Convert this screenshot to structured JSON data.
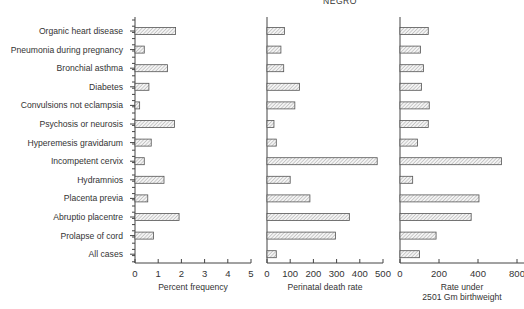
{
  "title": "NEGRO",
  "categories": [
    "Organic heart disease",
    "Pneumonia during pregnancy",
    "Bronchial asthma",
    "Diabetes",
    "Convulsions not eclampsia",
    "Psychosis or neurosis",
    "Hyperemesis gravidarum",
    "Incompetent cervix",
    "Hydramnios",
    "Placenta previa",
    "Abruptio placentre",
    "Prolapse of cord",
    "All cases"
  ],
  "panels": [
    {
      "xlabel": "Percent frequency",
      "xlabel2": "",
      "ticks": [
        "0",
        "1",
        "2",
        "3",
        "4",
        "5"
      ]
    },
    {
      "xlabel": "Perinatal death rate",
      "xlabel2": "",
      "ticks": [
        "0",
        "100",
        "200",
        "300",
        "400",
        "500"
      ]
    },
    {
      "xlabel": "Rate under",
      "xlabel2": "2501 Gm birthweight",
      "ticks": [
        "0",
        "200",
        "400",
        "800"
      ]
    }
  ],
  "chart_data": [
    {
      "type": "bar",
      "orientation": "horizontal",
      "title": "NEGRO",
      "xlabel": "Percent frequency",
      "ylabel": "",
      "xlim": [
        0,
        5
      ],
      "xticks": [
        0,
        1,
        2,
        3,
        4,
        5
      ],
      "grid": false,
      "categories": [
        "Organic heart disease",
        "Pneumonia during pregnancy",
        "Bronchial asthma",
        "Diabetes",
        "Convulsions not eclampsia",
        "Psychosis or neurosis",
        "Hyperemesis gravidarum",
        "Incompetent cervix",
        "Hydramnios",
        "Placenta previa",
        "Abruptio placentre",
        "Prolapse of cord",
        "All cases"
      ],
      "values": [
        1.75,
        0.4,
        1.4,
        0.6,
        0.2,
        1.7,
        0.7,
        0.4,
        1.25,
        0.55,
        1.9,
        0.8,
        null
      ]
    },
    {
      "type": "bar",
      "orientation": "horizontal",
      "title": "NEGRO",
      "xlabel": "Perinatal death rate",
      "ylabel": "",
      "xlim": [
        0,
        500
      ],
      "xticks": [
        0,
        100,
        200,
        300,
        400,
        500
      ],
      "grid": false,
      "categories": [
        "Organic heart disease",
        "Pneumonia during pregnancy",
        "Bronchial asthma",
        "Diabetes",
        "Convulsions not eclampsia",
        "Psychosis or neurosis",
        "Hyperemesis gravidarum",
        "Incompetent cervix",
        "Hydramnios",
        "Placenta previa",
        "Abruptio placentre",
        "Prolapse of cord",
        "All cases"
      ],
      "values": [
        75,
        60,
        72,
        140,
        120,
        30,
        40,
        475,
        100,
        185,
        355,
        295,
        40
      ]
    },
    {
      "type": "bar",
      "orientation": "horizontal",
      "title": "NEGRO",
      "xlabel": "Rate under 2501 Gm birthweight",
      "ylabel": "",
      "xlim": [
        0,
        800
      ],
      "xticks": [
        0,
        200,
        400,
        600
      ],
      "xtick_labels": [
        "0",
        "200",
        "400",
        "800"
      ],
      "grid": false,
      "categories": [
        "Organic heart disease",
        "Pneumonia during pregnancy",
        "Bronchial asthma",
        "Diabetes",
        "Convulsions not eclampsia",
        "Psychosis or neurosis",
        "Hyperemesis gravidarum",
        "Incompetent cervix",
        "Hydramnios",
        "Placenta previa",
        "Abruptio placentre",
        "Prolapse of cord",
        "All cases"
      ],
      "values": [
        145,
        105,
        120,
        110,
        150,
        145,
        90,
        520,
        65,
        405,
        365,
        185,
        100
      ]
    }
  ]
}
